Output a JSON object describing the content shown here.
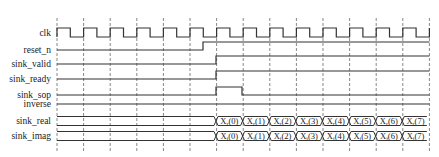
{
  "diagram": {
    "type": "timing-diagram",
    "grid": {
      "x_start": 57,
      "period": 26.6,
      "count": 15,
      "y_top": 18,
      "y_bottom": 152
    },
    "signals": [
      {
        "name": "clk",
        "y": 33,
        "kind": "clock"
      },
      {
        "name": "reset_n",
        "y": 50,
        "kind": "bit",
        "low_until": 203
      },
      {
        "name": "sink_valid",
        "y": 64,
        "kind": "bit",
        "low_until": 216
      },
      {
        "name": "sink_ready",
        "y": 79,
        "kind": "bit",
        "low_until": 216
      },
      {
        "name": "sink_sop",
        "y": 95,
        "kind": "pulse",
        "high_from": 216,
        "high_to": 242
      },
      {
        "name": "inverse",
        "y": 104,
        "kind": "low"
      },
      {
        "name": "sink_real",
        "y": 121,
        "kind": "bus",
        "start": 216,
        "values": [
          "X(0)",
          "X(1)",
          "X(2)",
          "X(3)",
          "X(4)",
          "X(5)",
          "X(6)",
          "X(7)"
        ],
        "sub": "r"
      },
      {
        "name": "sink_imag",
        "y": 136,
        "kind": "bus",
        "start": 216,
        "values": [
          "X(0)",
          "X(1)",
          "X(2)",
          "X(3)",
          "X(4)",
          "X(5)",
          "X(6)",
          "X(7)"
        ],
        "sub": "i"
      }
    ],
    "colors": {
      "line": "#333333",
      "grid": "#555555",
      "text": "#222222"
    }
  }
}
